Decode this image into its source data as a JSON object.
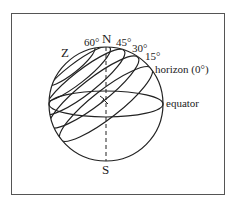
{
  "diagram": {
    "poles": {
      "north": "N",
      "south": "S"
    },
    "zenith": "Z",
    "altitude_labels": [
      "60°",
      "45°",
      "30°",
      "15°"
    ],
    "horizon_label": "horizon (0°)",
    "equator_label": "equator",
    "colors": {
      "line": "#222222",
      "frame": "#555555",
      "background": "#ffffff"
    }
  }
}
